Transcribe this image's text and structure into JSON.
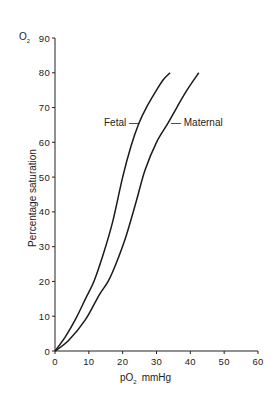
{
  "chart_data": {
    "type": "line",
    "title": "",
    "corner_label": "O₂",
    "xlabel": "pO₂ mmHg",
    "ylabel": "Percentage saturation",
    "xlim": [
      0,
      60
    ],
    "ylim": [
      0,
      90
    ],
    "xticks": [
      0,
      10,
      20,
      30,
      40,
      50,
      60
    ],
    "yticks": [
      0,
      10,
      20,
      30,
      40,
      50,
      60,
      70,
      80,
      90
    ],
    "grid": false,
    "legend": "inline labels",
    "series": [
      {
        "name": "Fetal",
        "x": [
          0,
          3,
          6,
          9,
          11.5,
          14,
          17,
          20,
          22.5,
          24.8,
          27,
          30,
          32,
          34
        ],
        "y": [
          0,
          4,
          9,
          15,
          20,
          27,
          37,
          50,
          59,
          65.5,
          70,
          75,
          78,
          80
        ]
      },
      {
        "name": "Maternal",
        "x": [
          0,
          4,
          9,
          13,
          15.7,
          18,
          21,
          24,
          26.6,
          30,
          33.4,
          36,
          39,
          42.5
        ],
        "y": [
          0,
          3,
          9,
          16,
          20,
          25,
          33,
          43,
          52,
          60,
          65.5,
          70,
          75,
          80
        ]
      }
    ],
    "annotations": [
      {
        "text": "Fetal",
        "near_series": "Fetal",
        "at": [
          24,
          65
        ]
      },
      {
        "text": "Maternal",
        "near_series": "Maternal",
        "at": [
          34,
          65
        ]
      }
    ]
  },
  "labels": {
    "corner": "O",
    "corner_sub": "2",
    "x_title_main": "pO",
    "x_title_sub": "2",
    "x_title_unit": "mmHg",
    "y_title": "Percentage saturation",
    "fetal": "Fetal",
    "maternal": "Maternal"
  }
}
